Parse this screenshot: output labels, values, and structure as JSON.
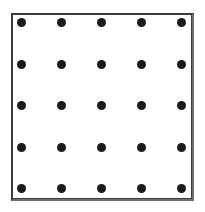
{
  "figure": {
    "title": "",
    "canvas": {
      "width": 205,
      "height": 212,
      "background": "#ffffff"
    },
    "frame": {
      "left": 11,
      "top": 13,
      "width": 183,
      "height": 188,
      "border_width": 2,
      "border_color": "#3c3c3c",
      "border_color_shadow": "#6e6e6e",
      "fill": "#ffffff"
    },
    "dots": {
      "rows": 5,
      "columns": 5,
      "count": 25,
      "diameter": 9,
      "color": "#1a1a1a",
      "column_centers_x": [
        21,
        61,
        101,
        141,
        181
      ],
      "row_centers_y": [
        22,
        64,
        105,
        147,
        188
      ],
      "column_spacing": 40,
      "row_spacing": 41.5
    }
  },
  "chart_data": {
    "type": "scatter",
    "title": "",
    "subtitle": "",
    "xlabel": "",
    "ylabel": "",
    "grid": false,
    "legend": "none",
    "xlim": [
      0,
      5
    ],
    "ylim": [
      0,
      5
    ],
    "marker": "filled-circle",
    "marker_color": "#1a1a1a",
    "marker_size": 9,
    "series": [
      {
        "name": "grid-points",
        "x": [
          1,
          2,
          3,
          4,
          5,
          1,
          2,
          3,
          4,
          5,
          1,
          2,
          3,
          4,
          5,
          1,
          2,
          3,
          4,
          5,
          1,
          2,
          3,
          4,
          5
        ],
        "y": [
          5,
          5,
          5,
          5,
          5,
          4,
          4,
          4,
          4,
          4,
          3,
          3,
          3,
          3,
          3,
          2,
          2,
          2,
          2,
          2,
          1,
          1,
          1,
          1,
          1
        ]
      }
    ],
    "xtick_labels": [],
    "ytick_labels": [],
    "annotations": []
  }
}
